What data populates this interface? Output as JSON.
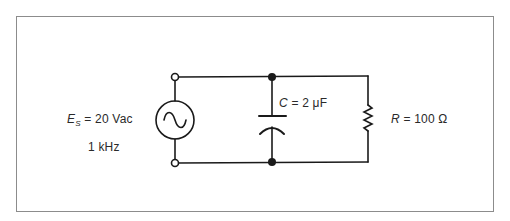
{
  "diagram": {
    "type": "circuit-schematic",
    "source": {
      "symbol": "E",
      "subscript": "S",
      "equals": "=",
      "value": "20 Vac",
      "frequency": "1 kHz"
    },
    "capacitor": {
      "symbol": "C",
      "equals": "=",
      "value": "2 μF"
    },
    "resistor": {
      "symbol": "R",
      "equals": "=",
      "value": "100 Ω"
    },
    "colors": {
      "line": "#1a1a1a",
      "frame": "#8c8c8c",
      "text": "#2a2a2a",
      "background": "#ffffff"
    }
  }
}
